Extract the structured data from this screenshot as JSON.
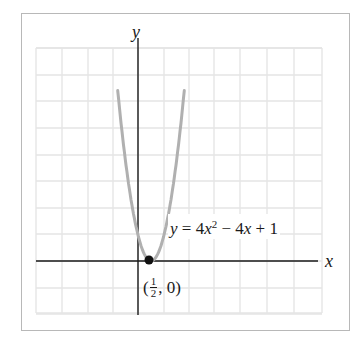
{
  "figure": {
    "equation_label": {
      "lhs": "y",
      "eq": " = 4",
      "var": "x",
      "exp": "2",
      "rest_op1": " − 4",
      "var2": "x",
      "rest_op2": " + 1"
    },
    "x_axis_label": "x",
    "y_axis_label": "y",
    "point_label": {
      "open": "(",
      "num": "1",
      "den": "2",
      "rest": ", 0)"
    },
    "colors": {
      "grid": "#e4e4e4",
      "axis": "#1a1a1a",
      "curve": "#b0b0b0",
      "point": "#111111",
      "border": "#b8b8b8"
    }
  },
  "chart_data": {
    "type": "line",
    "title": "",
    "function": "y = 4x^2 - 4x + 1",
    "xlabel": "x",
    "ylabel": "y",
    "grid": true,
    "xlim": [
      -3.9,
      7.1
    ],
    "ylim": [
      -2.1,
      8.1
    ],
    "curve_x_range": [
      -0.78,
      1.78
    ],
    "highlighted_point": {
      "x": 0.5,
      "y": 0,
      "label": "(1/2, 0)"
    },
    "series": [
      {
        "name": "y = 4x^2 - 4x + 1",
        "x": [
          -0.78,
          -0.5,
          -0.25,
          0,
          0.25,
          0.5,
          0.75,
          1,
          1.25,
          1.5,
          1.78
        ],
        "y": [
          6.55,
          4,
          2.25,
          1,
          0.25,
          0,
          0.25,
          1,
          2.25,
          4,
          6.55
        ]
      }
    ]
  },
  "layout": {
    "origin_px": [
      138,
      261
    ],
    "unit_px": 26,
    "grid_x": [
      36,
      62,
      88,
      113,
      138,
      164,
      189,
      214,
      240,
      267,
      294,
      322
    ],
    "grid_y": [
      48,
      74,
      99,
      125,
      150,
      176,
      202,
      228,
      235,
      261,
      288,
      313
    ]
  }
}
